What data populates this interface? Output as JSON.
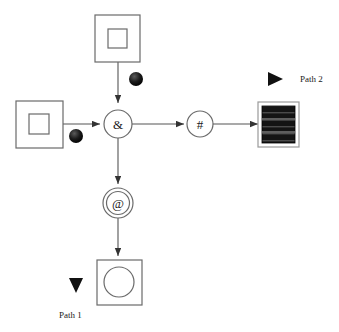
{
  "diagram": {
    "background_color": "#ffffff",
    "stroke_color": "#555555",
    "node_stroke_color": "#6a6a6a",
    "thick_edge_color": "#1a1a1a",
    "width": 339,
    "height": 332,
    "nodes": [
      {
        "id": "top-source",
        "shape": "square-in-square",
        "label": "",
        "x": 95,
        "y": 15,
        "w": 45,
        "h": 47,
        "inner_x": 108,
        "inner_y": 29,
        "inner_w": 19,
        "inner_h": 19
      },
      {
        "id": "left-source",
        "shape": "square-in-square",
        "label": "",
        "x": 16,
        "y": 101,
        "w": 47,
        "h": 47,
        "inner_x": 29,
        "inner_y": 114,
        "inner_w": 20,
        "inner_h": 20
      },
      {
        "id": "and-node",
        "shape": "circle",
        "label": "&",
        "cx": 118,
        "cy": 124,
        "r": 14
      },
      {
        "id": "hash-node",
        "shape": "circle",
        "label": "#",
        "cx": 200,
        "cy": 124,
        "r": 13
      },
      {
        "id": "at-node",
        "shape": "circle",
        "label": "@",
        "cx": 118,
        "cy": 203,
        "r": 15
      },
      {
        "id": "striped-sink",
        "shape": "filled-striped-square",
        "label": "",
        "x": 258,
        "y": 102,
        "w": 41,
        "h": 45
      },
      {
        "id": "circle-in-square-sink",
        "shape": "circle-in-square",
        "label": "",
        "x": 97,
        "y": 260,
        "w": 45,
        "h": 45,
        "inner_cx": 119,
        "inner_cy": 282,
        "inner_r": 15
      }
    ],
    "edges": [
      {
        "id": "edge-top-to-and",
        "from": "top-source",
        "to": "and-node",
        "style": "thin",
        "direction": "down"
      },
      {
        "id": "edge-left-to-and",
        "from": "left-source",
        "to": "and-node",
        "style": "thin",
        "direction": "right"
      },
      {
        "id": "edge-and-to-hash",
        "from": "and-node",
        "to": "hash-node",
        "style": "thin",
        "direction": "right"
      },
      {
        "id": "edge-hash-to-sink",
        "from": "hash-node",
        "to": "striped-sink",
        "style": "thin",
        "direction": "right"
      },
      {
        "id": "edge-and-to-at",
        "from": "and-node",
        "to": "at-node",
        "style": "thin",
        "direction": "down"
      },
      {
        "id": "edge-at-to-sink",
        "from": "at-node",
        "to": "circle-in-square-sink",
        "style": "thin",
        "direction": "down"
      }
    ],
    "paths": [
      {
        "id": "path-2",
        "label": "Path 2",
        "style": "thick",
        "direction": "right",
        "start_dot": {
          "cx": 136,
          "cy": 79,
          "r": 7
        },
        "line": {
          "x1": 136,
          "y1": 79,
          "x2": 283,
          "y2": 79
        },
        "label_x": 300,
        "label_y": 82
      },
      {
        "id": "path-1",
        "label": "Path 1",
        "style": "thick",
        "direction": "down",
        "start_dot": {
          "cx": 76,
          "cy": 136,
          "r": 7
        },
        "line": {
          "x1": 76,
          "y1": 136,
          "x2": 76,
          "y2": 293
        },
        "label_x": 59,
        "label_y": 318
      }
    ]
  }
}
